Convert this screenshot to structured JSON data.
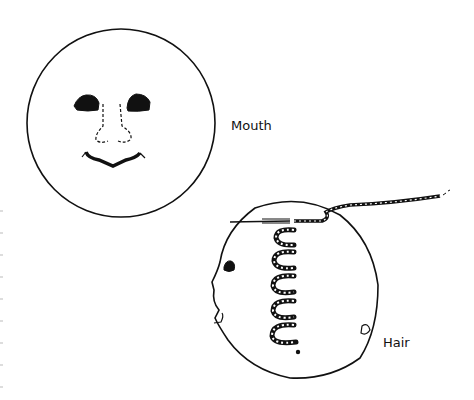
{
  "figures": [
    {
      "id": "mouth",
      "caption": "Mouth",
      "description": "Front-facing round doll face with embroidered eyes, dashed nose outline, and stitched mouth"
    },
    {
      "id": "hair",
      "caption": "Hair",
      "description": "Side-profile round doll head with looped yarn hair stitched down the center and a needle with thread at the top"
    }
  ],
  "colors": {
    "ink": "#111111",
    "paper": "#ffffff"
  }
}
